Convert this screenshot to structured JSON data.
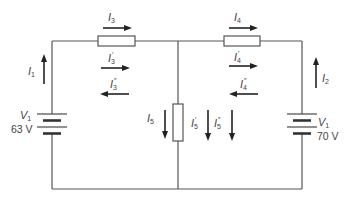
{
  "diagram": {
    "type": "circuit",
    "colors": {
      "wire": "#555555",
      "arrow": "#222222",
      "text": "#444444"
    },
    "sources": [
      {
        "id": "left",
        "name": "V",
        "sub": "1",
        "value": "63 V"
      },
      {
        "id": "right",
        "name": "V",
        "sub": "1",
        "value": "70 V"
      }
    ],
    "currents": {
      "i1": {
        "name": "I",
        "sub": "1",
        "prime": "",
        "direction": "up"
      },
      "i2": {
        "name": "I",
        "sub": "2",
        "prime": "",
        "direction": "up"
      },
      "i3": {
        "name": "I",
        "sub": "3",
        "prime": "",
        "direction": "right"
      },
      "i3p": {
        "name": "I",
        "sub": "3",
        "prime": "′",
        "direction": "right"
      },
      "i3pp": {
        "name": "I",
        "sub": "3",
        "prime": "″",
        "direction": "left"
      },
      "i4": {
        "name": "I",
        "sub": "4",
        "prime": "",
        "direction": "right"
      },
      "i4p": {
        "name": "I",
        "sub": "4",
        "prime": "′",
        "direction": "right"
      },
      "i4pp": {
        "name": "I",
        "sub": "4",
        "prime": "″",
        "direction": "left"
      },
      "i5": {
        "name": "I",
        "sub": "5",
        "prime": "",
        "direction": "down"
      },
      "i5p": {
        "name": "I",
        "sub": "5",
        "prime": "′",
        "direction": "down"
      },
      "i5pp": {
        "name": "I",
        "sub": "5",
        "prime": "″",
        "direction": "down"
      }
    }
  }
}
